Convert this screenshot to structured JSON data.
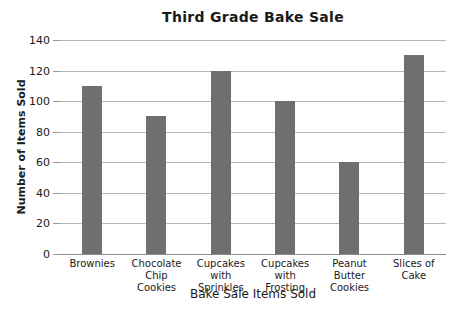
{
  "chart_data": {
    "type": "bar",
    "title": "Third Grade Bake Sale",
    "xlabel": "Bake Sale Items Sold",
    "ylabel": "Number of Items Sold",
    "categories": [
      "Brownies",
      "Chocolate Chip Cookies",
      "Cupcakes with Sprinkles",
      "Cupcakes with Frosting",
      "Peanut Butter Cookies",
      "Slices of Cake"
    ],
    "category_labels_wrapped": [
      "Brownies",
      "Chocolate\nChip\nCookies",
      "Cupcakes\nwith\nSprinkles",
      "Cupcakes\nwith\nFrosting",
      "Peanut\nButter\nCookies",
      "Slices of\nCake"
    ],
    "values": [
      110,
      90,
      120,
      100,
      60,
      130
    ],
    "yticks": [
      0,
      20,
      40,
      60,
      80,
      100,
      120,
      140
    ],
    "ylim": [
      0,
      140
    ],
    "grid": true,
    "legend": false,
    "colors": {
      "bar": "#6f6f6f",
      "gridline": "#b5b5b5",
      "axis_line": "#8c8c8c",
      "tick_stub": "#9a9a9a",
      "text": "#1a1a1a",
      "background": "#ffffff"
    }
  }
}
